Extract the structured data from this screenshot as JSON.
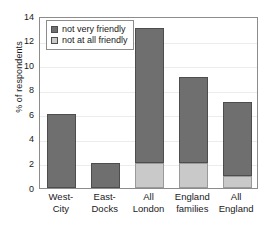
{
  "chart_data": {
    "type": "bar",
    "stacked": true,
    "title": "",
    "xlabel": "",
    "ylabel": "% of respondents",
    "ylim": [
      0,
      14
    ],
    "ytick_step": 2,
    "yticks": [
      "14",
      "12",
      "10",
      "8",
      "6",
      "4",
      "2",
      "0"
    ],
    "grid": true,
    "legend_position": "top-left",
    "categories": [
      "West-City",
      "East-Docks",
      "All London",
      "England families",
      "All England"
    ],
    "category_lines": [
      [
        "West-",
        "City"
      ],
      [
        "East-",
        "Docks"
      ],
      [
        "All",
        "London"
      ],
      [
        "England",
        "families"
      ],
      [
        "All",
        "England"
      ]
    ],
    "series": [
      {
        "name": "not very friendly",
        "color": "#6f6f6f",
        "values": [
          6,
          2,
          11,
          7,
          6
        ]
      },
      {
        "name": "not at all friendly",
        "color": "#c9c9c9",
        "values": [
          0,
          0,
          2,
          2,
          1
        ]
      }
    ],
    "totals": [
      6,
      2,
      13,
      9,
      7
    ]
  },
  "legend": {
    "items": [
      {
        "label": "not very friendly",
        "color": "#6f6f6f"
      },
      {
        "label": "not at all friendly",
        "color": "#c9c9c9"
      }
    ]
  },
  "axes": {
    "y_title": "% of respondents"
  },
  "colors": {
    "dark_gray": "#6f6f6f",
    "light_gray": "#c9c9c9",
    "frame": "#8c8c8c",
    "gridline": "#ececec",
    "background": "#ffffff",
    "text": "#1a1a1a"
  }
}
